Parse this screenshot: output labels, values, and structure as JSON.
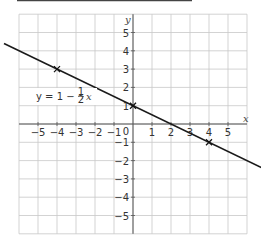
{
  "chart_data": {
    "type": "line",
    "title": "",
    "xlabel": "x",
    "ylabel": "y",
    "xlim": [
      -6,
      6
    ],
    "ylim": [
      -6,
      6
    ],
    "grid": true,
    "x_ticks": [
      -5,
      -4,
      -3,
      -2,
      -1,
      1,
      2,
      3,
      4,
      5
    ],
    "y_ticks": [
      5,
      4,
      3,
      2,
      1,
      -1,
      -2,
      -3,
      -4,
      -5
    ],
    "origin_label": "0",
    "series": [
      {
        "name": "y = 1 − ½x",
        "equation": "y = 1 - (1/2)x",
        "slope": -0.5,
        "intercept": 1,
        "x_range": [
          -6,
          6.8
        ]
      }
    ],
    "marked_points": [
      {
        "x": -4,
        "y": 3
      },
      {
        "x": 0,
        "y": 1
      },
      {
        "x": 4,
        "y": -1
      }
    ],
    "annotations": [
      {
        "text_parts": [
          "y = 1 − ",
          "1",
          "2",
          "x"
        ],
        "at": {
          "x": -4.5,
          "y": 1.5
        }
      }
    ]
  },
  "labels": {
    "x_axis": "x",
    "y_axis": "y",
    "origin": "0",
    "eq_prefix": "y = 1 − ",
    "eq_num": "1",
    "eq_den": "2",
    "eq_var": "x"
  }
}
